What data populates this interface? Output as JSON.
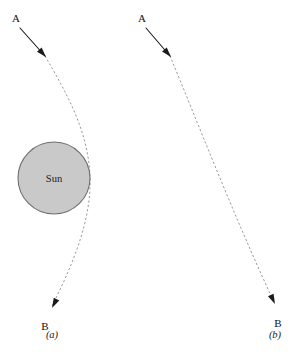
{
  "figure": {
    "background_color": "#ffffff",
    "width": 301,
    "height": 355
  },
  "colors": {
    "sun_fill": "#c9c9c9",
    "sun_stroke": "#6f6f6f",
    "ray_dashed": "#9a9a9a",
    "ray_solid": "#1a1a1a",
    "text": "#111111"
  },
  "panels": [
    {
      "id": "panel-a",
      "caption": "(a)",
      "caption_x": 52,
      "caption_y": 338,
      "start_label": "A",
      "start_label_x": 16,
      "start_label_y": 22,
      "end_label": "B",
      "end_label_x": 45,
      "end_label_y": 330,
      "has_sun": true,
      "sun": {
        "label": "Sun",
        "center_x": 54,
        "center_y": 178,
        "radius": 36,
        "label_x": 54,
        "label_y": 182
      },
      "ray_solid_path": "M 20 28 L 45 56",
      "ray_dashed_path": "M 45 56 C 66 92, 88 130, 90 176 C 92 222, 70 270, 52 306",
      "arrow_mid": {
        "x": 46,
        "y": 57,
        "angle": 48
      },
      "arrow_end": {
        "x": 52,
        "y": 308,
        "angle": 117
      }
    },
    {
      "id": "panel-b",
      "caption": "(b)",
      "caption_x": 275,
      "caption_y": 338,
      "start_label": "A",
      "start_label_x": 142,
      "start_label_y": 22,
      "end_label": "B",
      "end_label_x": 278,
      "end_label_y": 327,
      "has_sun": false,
      "ray_solid_path": "M 146 28 L 170 56",
      "ray_dashed_path": "M 170 56 C 196 118, 232 212, 274 302",
      "arrow_mid": {
        "x": 171,
        "y": 57,
        "angle": 49
      },
      "arrow_end": {
        "x": 275,
        "y": 304,
        "angle": 65
      }
    }
  ]
}
